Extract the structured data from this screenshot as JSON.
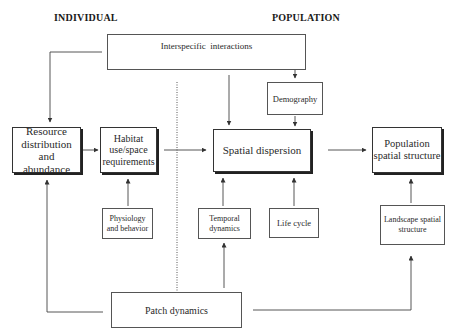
{
  "headers": {
    "individual": "INDIVIDUAL",
    "population": "POPULATION"
  },
  "nodes": {
    "interspecific": "Interspecific  interactions",
    "demography": "Demography",
    "resource": "Resource distribution and abundance",
    "habitat": "Habitat use/space requirements",
    "spatial_dispersion": "Spatial dispersion",
    "population_structure": "Population spatial structure",
    "physiology": "Physiology and behavior",
    "temporal": "Temporal dynamics",
    "life_cycle": "Life cycle",
    "landscape": "Landscape spatial structure",
    "patch": "Patch dynamics"
  },
  "edges": [
    {
      "from": "interspecific",
      "to": "resource"
    },
    {
      "from": "interspecific",
      "to": "spatial_dispersion"
    },
    {
      "from": "interspecific",
      "to": "demography"
    },
    {
      "from": "demography",
      "to": "spatial_dispersion"
    },
    {
      "from": "resource",
      "to": "habitat"
    },
    {
      "from": "habitat",
      "to": "spatial_dispersion"
    },
    {
      "from": "spatial_dispersion",
      "to": "population_structure"
    },
    {
      "from": "physiology",
      "to": "habitat"
    },
    {
      "from": "temporal",
      "to": "spatial_dispersion"
    },
    {
      "from": "life_cycle",
      "to": "spatial_dispersion"
    },
    {
      "from": "landscape",
      "to": "population_structure"
    },
    {
      "from": "patch",
      "to": "temporal"
    },
    {
      "from": "patch",
      "to": "resource"
    },
    {
      "from": "patch",
      "to": "landscape"
    }
  ],
  "colors": {
    "line": "#444444",
    "border": "#333333",
    "background": "#ffffff"
  }
}
